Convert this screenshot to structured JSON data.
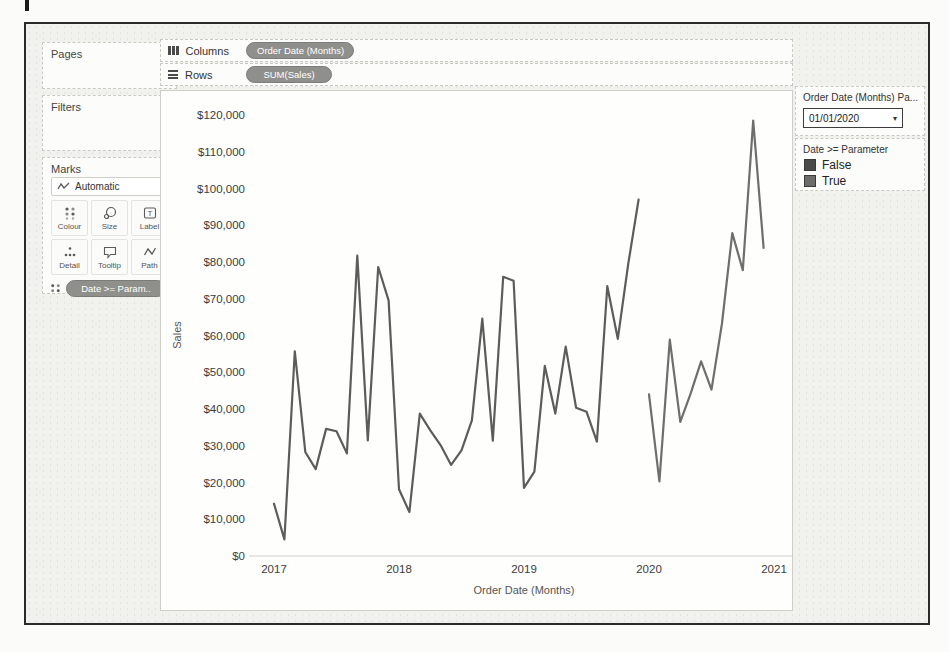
{
  "left_panel": {
    "pages_label": "Pages",
    "filters_label": "Filters",
    "marks_label": "Marks",
    "mark_type_value": "Automatic",
    "buttons": [
      {
        "label": "Colour",
        "icon": "colour-grid-icon"
      },
      {
        "label": "Size",
        "icon": "size-icon"
      },
      {
        "label": "Label",
        "icon": "label-icon"
      },
      {
        "label": "Detail",
        "icon": "detail-icon"
      },
      {
        "label": "Tooltip",
        "icon": "tooltip-icon"
      },
      {
        "label": "Path",
        "icon": "path-icon"
      }
    ],
    "marks_pill": "Date >= Param.."
  },
  "shelves": {
    "columns_label": "Columns",
    "columns_pill": "Order Date (Months)",
    "rows_label": "Rows",
    "rows_pill": "SUM(Sales)"
  },
  "right_panel": {
    "parameter_title": "Order Date (Months) Pa...",
    "parameter_value": "01/01/2020",
    "legend_title": "Date >= Parameter",
    "legend_items": [
      {
        "label": "False",
        "color": "#4a4a48"
      },
      {
        "label": "True",
        "color": "#6c6c6a"
      }
    ]
  },
  "chart_data": {
    "type": "line",
    "title": "",
    "xlabel": "Order Date (Months)",
    "ylabel": "Sales",
    "x_tick_labels": [
      "2017",
      "2018",
      "2019",
      "2020",
      "2021"
    ],
    "x_tick_months": [
      0,
      12,
      24,
      36,
      48
    ],
    "months_span": 48,
    "y_ticks": [
      0,
      10000,
      20000,
      30000,
      40000,
      50000,
      60000,
      70000,
      80000,
      90000,
      100000,
      110000,
      120000
    ],
    "ylim": [
      0,
      126000
    ],
    "grid": "off",
    "legend_position": "right",
    "series": [
      {
        "name": "False",
        "color": "#5c5c5a",
        "start_month": 0,
        "months": "Jan 2017 - Dec 2019",
        "values": [
          14237,
          4520,
          55691,
          28295,
          23648,
          34595,
          33946,
          27909,
          81777,
          31453,
          78629,
          69545,
          18174,
          11951,
          38726,
          34195,
          30131,
          24797,
          28765,
          36898,
          64595,
          31404,
          75973,
          74920,
          18542,
          22978,
          51715,
          38750,
          56988,
          40344,
          39262,
          31115,
          73410,
          59111,
          79412,
          96999
        ]
      },
      {
        "name": "True",
        "color": "#6e6e6c",
        "start_month": 36,
        "months": "Jan 2020 - Dec 2020",
        "values": [
          43971,
          20301,
          58872,
          36522,
          44261,
          52982,
          45264,
          63121,
          87867,
          77777,
          118448,
          83829
        ]
      }
    ]
  }
}
